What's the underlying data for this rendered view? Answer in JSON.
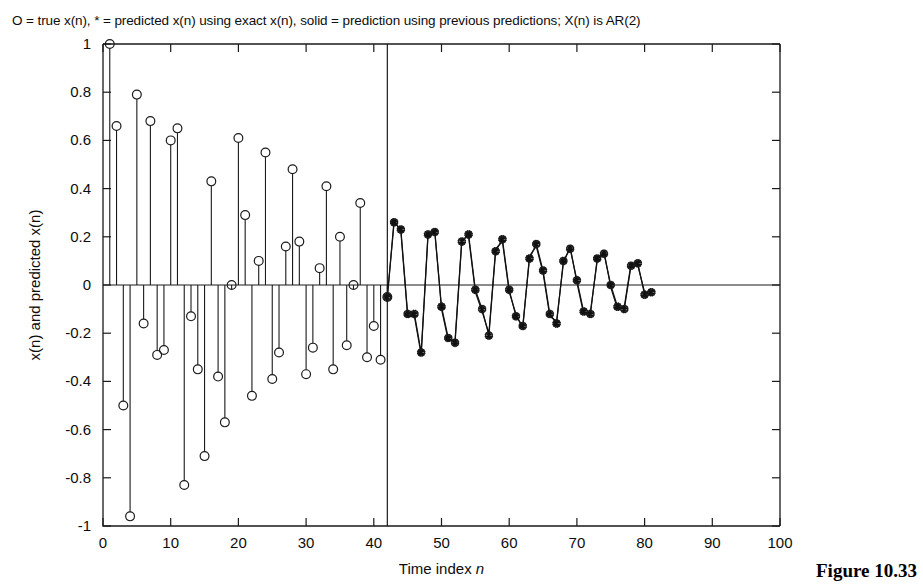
{
  "figure": {
    "caption": "Figure 10.33",
    "title": "O = true x(n), * = predicted x(n) using exact x(n), solid = prediction using previous predictions; X(n) is AR(2)"
  },
  "chart_data": {
    "type": "line",
    "title": "O = true x(n), * = predicted x(n) using exact x(n), solid = prediction using previous predictions; X(n) is AR(2)",
    "xlabel": "Time index n",
    "ylabel": "x(n) and predicted x(n)",
    "xlim": [
      0,
      100
    ],
    "ylim": [
      -1,
      1
    ],
    "xticks": [
      0,
      10,
      20,
      30,
      40,
      50,
      60,
      70,
      80,
      90,
      100
    ],
    "yticks": [
      -1,
      -0.8,
      -0.6,
      -0.4,
      -0.2,
      0,
      0.2,
      0.4,
      0.6,
      0.8,
      1
    ],
    "grid": false,
    "legend": "none",
    "annotations": [
      {
        "type": "vertical-divider",
        "x": 42,
        "label": "prediction-start"
      }
    ],
    "series": [
      {
        "name": "true x(n) (stem, O markers)",
        "marker": "circle",
        "style": "stem",
        "x": [
          1,
          2,
          3,
          4,
          5,
          6,
          7,
          8,
          9,
          10,
          11,
          12,
          13,
          14,
          15,
          16,
          17,
          18,
          19,
          20,
          21,
          22,
          23,
          24,
          25,
          26,
          27,
          28,
          29,
          30,
          31,
          32,
          33,
          34,
          35,
          36,
          37,
          38,
          39,
          40,
          41,
          42
        ],
        "y": [
          1.0,
          0.66,
          -0.5,
          -0.96,
          0.79,
          -0.16,
          0.68,
          -0.29,
          -0.27,
          0.6,
          0.65,
          -0.83,
          -0.13,
          -0.35,
          -0.71,
          0.43,
          -0.38,
          -0.57,
          0.0,
          0.61,
          0.29,
          -0.46,
          0.1,
          0.55,
          -0.39,
          -0.28,
          0.16,
          0.48,
          0.18,
          -0.37,
          -0.26,
          0.07,
          0.41,
          -0.35,
          0.2,
          -0.25,
          0.0,
          0.34,
          -0.3,
          -0.17,
          -0.31,
          -0.05
        ]
      },
      {
        "name": "predicted x(n) using exact x(n) (* markers)",
        "marker": "star",
        "style": "markers-and-line",
        "x": [
          42,
          43,
          44,
          45,
          46,
          47,
          48,
          49,
          50,
          51,
          52,
          53,
          54,
          55,
          56,
          57,
          58,
          59,
          60,
          61,
          62,
          63,
          64,
          65,
          66,
          67,
          68,
          69,
          70,
          71,
          72,
          73,
          74,
          75,
          76,
          77,
          78,
          79,
          80,
          81
        ],
        "y": [
          -0.05,
          0.26,
          0.23,
          -0.12,
          -0.12,
          -0.28,
          0.21,
          0.22,
          -0.09,
          -0.22,
          -0.24,
          0.18,
          0.21,
          -0.02,
          -0.1,
          -0.21,
          0.14,
          0.19,
          -0.02,
          -0.13,
          -0.17,
          0.11,
          0.17,
          0.06,
          -0.12,
          -0.16,
          0.1,
          0.15,
          0.02,
          -0.11,
          -0.12,
          0.11,
          0.13,
          0.0,
          -0.09,
          -0.1,
          0.08,
          0.09,
          -0.04,
          -0.03
        ]
      },
      {
        "name": "prediction using previous predictions (solid)",
        "marker": "none",
        "style": "line",
        "x": [
          42,
          43,
          44,
          45,
          46,
          47,
          48,
          49,
          50,
          51,
          52,
          53,
          54,
          55,
          56,
          57,
          58,
          59,
          60,
          61,
          62,
          63,
          64,
          65,
          66,
          67,
          68,
          69,
          70,
          71,
          72,
          73,
          74,
          75,
          76,
          77,
          78,
          79,
          80,
          81
        ],
        "y": [
          -0.05,
          0.27,
          0.22,
          -0.13,
          -0.13,
          -0.29,
          0.2,
          0.23,
          -0.1,
          -0.23,
          -0.23,
          0.19,
          0.2,
          -0.03,
          -0.11,
          -0.2,
          0.15,
          0.18,
          -0.03,
          -0.12,
          -0.18,
          0.12,
          0.16,
          0.05,
          -0.13,
          -0.15,
          0.09,
          0.16,
          0.01,
          -0.12,
          -0.11,
          0.1,
          0.14,
          -0.01,
          -0.1,
          -0.09,
          0.09,
          0.08,
          -0.03,
          -0.04
        ]
      }
    ]
  }
}
